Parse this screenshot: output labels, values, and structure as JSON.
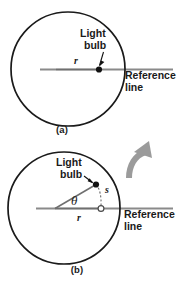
{
  "figure": {
    "background_color": "#ffffff",
    "ink_color": "#1a1a1a",
    "accent_gray": "#8a8a8a",
    "panels": [
      {
        "id": "a",
        "caption": "(a)",
        "circle": {
          "cx": 68,
          "cy": 69,
          "r": 57,
          "stroke": "#1a1a1a"
        },
        "labels": {
          "light_bulb_line1": "Light",
          "light_bulb_line2": "bulb",
          "radius_symbol": "r",
          "reference_line1": "Reference",
          "reference_line2": "line"
        },
        "markers": {
          "bulb_point": {
            "x": 99,
            "y": 69,
            "type": "filled-dot"
          }
        },
        "reference_line": {
          "x1": 40,
          "y1": 69,
          "x2": 173,
          "y2": 69,
          "color": "#8a8a8a"
        }
      },
      {
        "id": "b",
        "caption": "(b)",
        "circle": {
          "cx": 64,
          "cy": 208,
          "r": 56,
          "stroke": "#1a1a1a"
        },
        "labels": {
          "light_bulb_line1": "Light",
          "light_bulb_line2": "bulb",
          "arc_symbol": "s",
          "angle_symbol": "θ",
          "radius_symbol": "r",
          "reference_line1": "Reference",
          "reference_line2": "line"
        },
        "markers": {
          "bulb_point": {
            "x": 96,
            "y": 184,
            "type": "filled-dot"
          },
          "reference_point": {
            "x": 101,
            "y": 208,
            "type": "open-dot"
          }
        },
        "reference_line": {
          "x1": 36,
          "y1": 208,
          "x2": 173,
          "y2": 208,
          "color": "#8a8a8a"
        },
        "rotation_arrow": {
          "direction": "counter-clockwise",
          "color": "#9b9b9b"
        }
      }
    ]
  }
}
